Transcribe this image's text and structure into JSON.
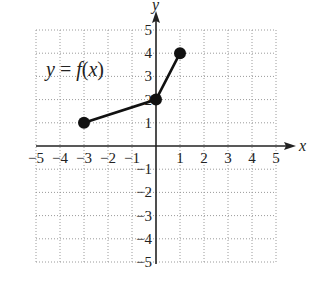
{
  "chart_data": {
    "type": "line",
    "title": "",
    "annotation": "y = f(x)",
    "xlabel": "x",
    "ylabel": "y",
    "xlim": [
      -5,
      5
    ],
    "ylim": [
      -5,
      5
    ],
    "grid": true,
    "x_ticks": [
      -5,
      -4,
      -3,
      -2,
      -1,
      1,
      2,
      3,
      4,
      5
    ],
    "y_ticks": [
      -5,
      -4,
      -3,
      -2,
      -1,
      1,
      2,
      3,
      4,
      5
    ],
    "series": [
      {
        "name": "f(x)",
        "points": [
          [
            -3,
            1
          ],
          [
            0,
            2
          ],
          [
            1,
            4
          ]
        ],
        "markers": "closed-dots",
        "color": "#111111"
      }
    ]
  },
  "labels": {
    "function": "y = f(x)",
    "x_axis": "x",
    "y_axis": "y",
    "x_ticks": [
      "−5",
      "−4",
      "−3",
      "−2",
      "−1",
      "1",
      "2",
      "3",
      "4",
      "5"
    ],
    "y_ticks": [
      "5",
      "4",
      "3",
      "2",
      "1",
      "−1",
      "−2",
      "−3",
      "−4",
      "−5"
    ]
  },
  "colors": {
    "axis": "#222222",
    "grid": "#9a9a9a",
    "curve": "#111111"
  }
}
